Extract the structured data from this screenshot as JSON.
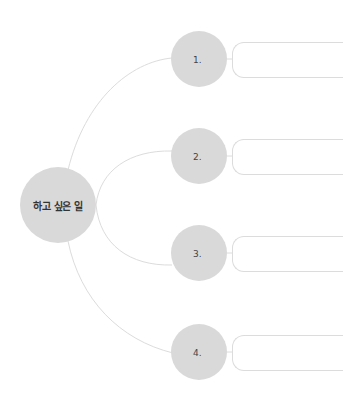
{
  "diagram": {
    "center": {
      "label": "하고 싶은 일"
    },
    "branches": [
      {
        "label": "1.",
        "text": ""
      },
      {
        "label": "2.",
        "text": ""
      },
      {
        "label": "3.",
        "text": ""
      },
      {
        "label": "4.",
        "text": ""
      }
    ],
    "colors": {
      "node_fill": "#d9d9d9",
      "line": "#dcdcdc",
      "box_border": "#dcdcdc"
    }
  }
}
